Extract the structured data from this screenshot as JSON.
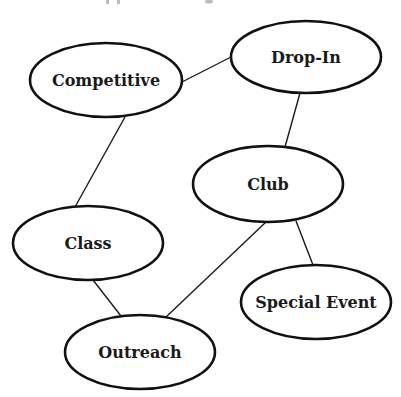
{
  "diagram": {
    "type": "concept-map",
    "title_visible": false,
    "nodes": [
      {
        "id": "competitive",
        "label": "Competitive",
        "cx": 106,
        "cy": 80,
        "rx": 76,
        "ry": 37
      },
      {
        "id": "drop-in",
        "label": "Drop-In",
        "cx": 306,
        "cy": 57,
        "rx": 75,
        "ry": 36
      },
      {
        "id": "club",
        "label": "Club",
        "cx": 268,
        "cy": 184,
        "rx": 75,
        "ry": 38
      },
      {
        "id": "class",
        "label": "Class",
        "cx": 88,
        "cy": 243,
        "rx": 75,
        "ry": 37
      },
      {
        "id": "special-event",
        "label": "Special Event",
        "cx": 316,
        "cy": 302,
        "rx": 75,
        "ry": 37
      },
      {
        "id": "outreach",
        "label": "Outreach",
        "cx": 140,
        "cy": 352,
        "rx": 75,
        "ry": 37
      }
    ],
    "edges": [
      {
        "from": "competitive",
        "to": "drop-in",
        "x1": 180,
        "y1": 83,
        "x2": 231,
        "y2": 57
      },
      {
        "from": "competitive",
        "to": "class",
        "x1": 125,
        "y1": 117,
        "x2": 75,
        "y2": 207
      },
      {
        "from": "drop-in",
        "to": "club",
        "x1": 300,
        "y1": 93,
        "x2": 285,
        "y2": 147
      },
      {
        "from": "club",
        "to": "outreach",
        "x1": 266,
        "y1": 222,
        "x2": 166,
        "y2": 317
      },
      {
        "from": "club",
        "to": "special-event",
        "x1": 296,
        "y1": 221,
        "x2": 313,
        "y2": 265
      },
      {
        "from": "class",
        "to": "outreach",
        "x1": 93,
        "y1": 280,
        "x2": 121,
        "y2": 316
      }
    ]
  },
  "colors": {
    "background": "#ffffff",
    "stroke": "#111111",
    "text": "#1a1a1a"
  }
}
